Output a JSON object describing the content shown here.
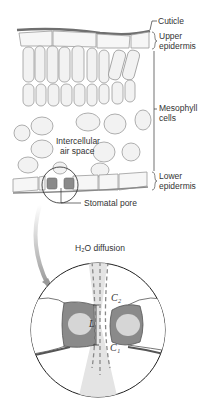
{
  "labels": {
    "cuticle": "Cuticle",
    "upper_epidermis_1": "Upper",
    "upper_epidermis_2": "epidermis",
    "mesophyll_1": "Mesophyll",
    "mesophyll_2": "cells",
    "intercellular_1": "Intercellular",
    "intercellular_2": "air space",
    "lower_epidermis_1": "Lower",
    "lower_epidermis_2": "epidermis",
    "stomatal_pore": "Stomatal pore",
    "diffusion_title": "H₂O diffusion",
    "c2": "C₂",
    "c1": "C₁",
    "L": "L"
  },
  "colors": {
    "cuticle": "#777777",
    "cell_outline": "#9a9a9a",
    "cell_fill": "#f4f4f4",
    "guard_cell": "#8c8c8c",
    "guard_nucleus": "#d8d8d8",
    "diffusion_cone": "#e6e6e6",
    "arrow": "#aaaaaa"
  }
}
